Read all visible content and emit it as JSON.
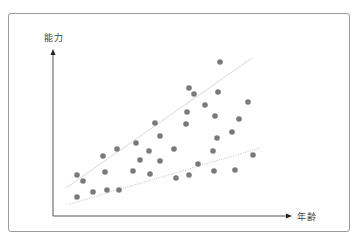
{
  "diagram": {
    "y_axis_label": "能力",
    "x_axis_label": "年齢",
    "colors": {
      "frame": "#9a9a9a",
      "axis": "#555555",
      "dot": "#7a7a7a",
      "upper_trend": "#d8d8d8",
      "lower_trend": "#bdbdbd",
      "label": "#444444"
    }
  },
  "chart_data": {
    "type": "scatter",
    "title": "",
    "xlabel": "年齢",
    "ylabel": "能力",
    "grid": false,
    "legend": null,
    "axis_ticks": "none",
    "note": "Points are in pixel coordinates (origin at top-left of image); the chart has no numeric scale. Two trend lines form a widening fan: an upper solid light line and a lower dotted line.",
    "points": [
      [
        220,
        62
      ],
      [
        189,
        88
      ],
      [
        194,
        94
      ],
      [
        218,
        92
      ],
      [
        248,
        102
      ],
      [
        205,
        105
      ],
      [
        187,
        112
      ],
      [
        215,
        116
      ],
      [
        239,
        119
      ],
      [
        155,
        123
      ],
      [
        186,
        124
      ],
      [
        232,
        132
      ],
      [
        160,
        136
      ],
      [
        217,
        138
      ],
      [
        136,
        143
      ],
      [
        117,
        149
      ],
      [
        149,
        151
      ],
      [
        174,
        149
      ],
      [
        213,
        151
      ],
      [
        253,
        155
      ],
      [
        103,
        156
      ],
      [
        140,
        160
      ],
      [
        160,
        161
      ],
      [
        198,
        164
      ],
      [
        105,
        172
      ],
      [
        133,
        171
      ],
      [
        150,
        174
      ],
      [
        214,
        171
      ],
      [
        235,
        170
      ],
      [
        77,
        175
      ],
      [
        83,
        181
      ],
      [
        176,
        178
      ],
      [
        189,
        175
      ],
      [
        77,
        197
      ],
      [
        93,
        192
      ],
      [
        107,
        190
      ],
      [
        119,
        190
      ]
    ],
    "trend_lines": [
      {
        "name": "upper",
        "style": "solid",
        "from": [
          66,
          188
        ],
        "to": [
          252,
          58
        ]
      },
      {
        "name": "lower",
        "style": "dotted",
        "from": [
          70,
          204
        ],
        "to": [
          260,
          148
        ]
      }
    ],
    "axes": {
      "origin": [
        53,
        216
      ],
      "y_axis_top": [
        53,
        49
      ],
      "x_axis_right": [
        292,
        216
      ]
    }
  }
}
